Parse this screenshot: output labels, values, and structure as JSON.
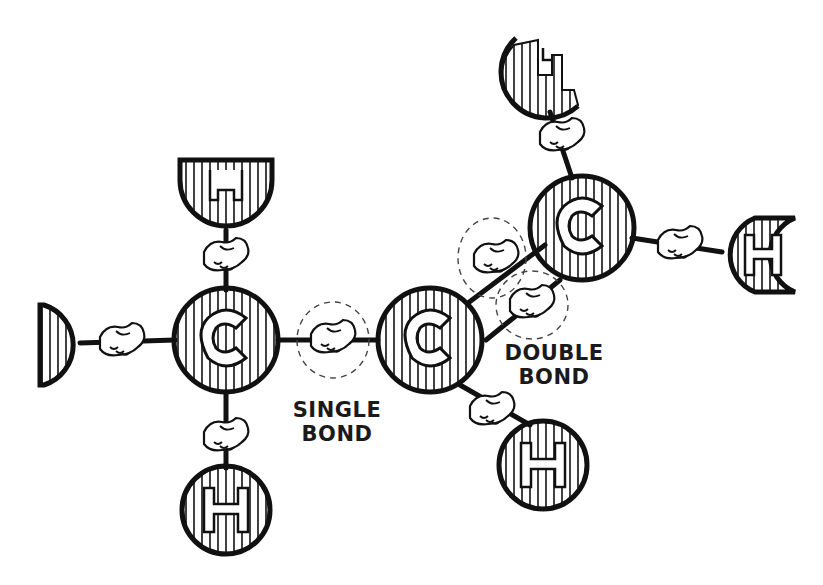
{
  "diagram": {
    "type": "molecule-cartoon",
    "colors": {
      "ink": "#111111",
      "paper": "#ffffff"
    },
    "atoms": [
      {
        "id": "C1",
        "symbol": "C",
        "x": 226,
        "y": 340,
        "r": 52
      },
      {
        "id": "C2",
        "symbol": "C",
        "x": 430,
        "y": 340,
        "r": 52
      },
      {
        "id": "C3",
        "symbol": "C",
        "x": 582,
        "y": 228,
        "r": 52
      },
      {
        "id": "H1",
        "symbol": "H",
        "x": 226,
        "y": 185,
        "r": 46
      },
      {
        "id": "H2",
        "symbol": "H",
        "x": 40,
        "y": 345,
        "r": 42
      },
      {
        "id": "H3",
        "symbol": "H",
        "x": 226,
        "y": 510,
        "r": 44
      },
      {
        "id": "H4",
        "symbol": "H",
        "x": 543,
        "y": 465,
        "r": 44
      },
      {
        "id": "H5",
        "symbol": "H",
        "x": 540,
        "y": 75,
        "r": 40
      },
      {
        "id": "H6",
        "symbol": "H",
        "x": 762,
        "y": 255,
        "r": 40
      }
    ],
    "labels": {
      "single_bond_line1": "SINGLE",
      "single_bond_line2": "BOND",
      "double_bond_line1": "DOUBLE",
      "double_bond_line2": "BOND"
    }
  }
}
